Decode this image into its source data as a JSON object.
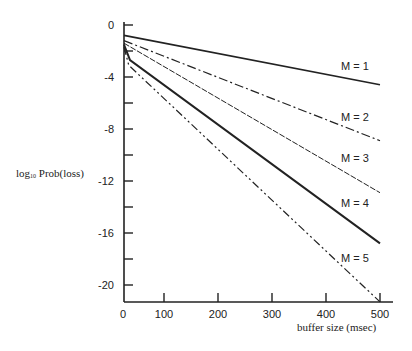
{
  "chart_data": {
    "type": "line",
    "title": "",
    "xlabel": "buffer size (msec)",
    "ylabel": "log10 Prob(loss)",
    "ylabel_parts": {
      "base": "log",
      "sub": "10",
      "rest": " Prob(loss)"
    },
    "xlim": [
      0,
      520
    ],
    "ylim": [
      -21.3,
      0
    ],
    "x_ticks": [
      0,
      100,
      200,
      300,
      400,
      500
    ],
    "x_tick_labels": [
      "0",
      "100",
      "200",
      "300",
      "400",
      "500"
    ],
    "y_ticks_major": [
      0,
      -4,
      -8,
      -12,
      -16,
      -20
    ],
    "y_tick_labels": [
      "0",
      "-4",
      "-8",
      "-12",
      "-16",
      "-20"
    ],
    "y_ticks_minor": [
      -2,
      -6,
      -10,
      -14,
      -18
    ],
    "grid": false,
    "legend": "inline labels at right end of each line",
    "series": [
      {
        "name": "M = 1",
        "style": "solid",
        "width": 1.6,
        "points": [
          [
            0,
            -0.8
          ],
          [
            500,
            -4.6
          ]
        ]
      },
      {
        "name": "M = 2",
        "style": "dash-dot",
        "width": 1.2,
        "points": [
          [
            0,
            -1.2
          ],
          [
            500,
            -8.9
          ]
        ]
      },
      {
        "name": "M = 3",
        "style": "dashed-fine",
        "width": 1.0,
        "points": [
          [
            0,
            -1.4
          ],
          [
            500,
            -12.9
          ]
        ]
      },
      {
        "name": "M = 4",
        "style": "solid",
        "width": 2.0,
        "points": [
          [
            0,
            -1.5
          ],
          [
            15,
            -2.7
          ],
          [
            500,
            -16.8
          ]
        ]
      },
      {
        "name": "M = 5",
        "style": "dash-dot-dot",
        "width": 1.2,
        "points": [
          [
            0,
            -1.7
          ],
          [
            12,
            -3.1
          ],
          [
            500,
            -21.3
          ]
        ]
      }
    ],
    "series_labels_pos": [
      {
        "label": "M = 1",
        "px": [
          341,
          70
        ]
      },
      {
        "label": "M = 2",
        "px": [
          341,
          121
        ]
      },
      {
        "label": "M = 3",
        "px": [
          341,
          162
        ]
      },
      {
        "label": "M = 4",
        "px": [
          341,
          207
        ]
      },
      {
        "label": "M = 5",
        "px": [
          341,
          262
        ]
      }
    ]
  }
}
